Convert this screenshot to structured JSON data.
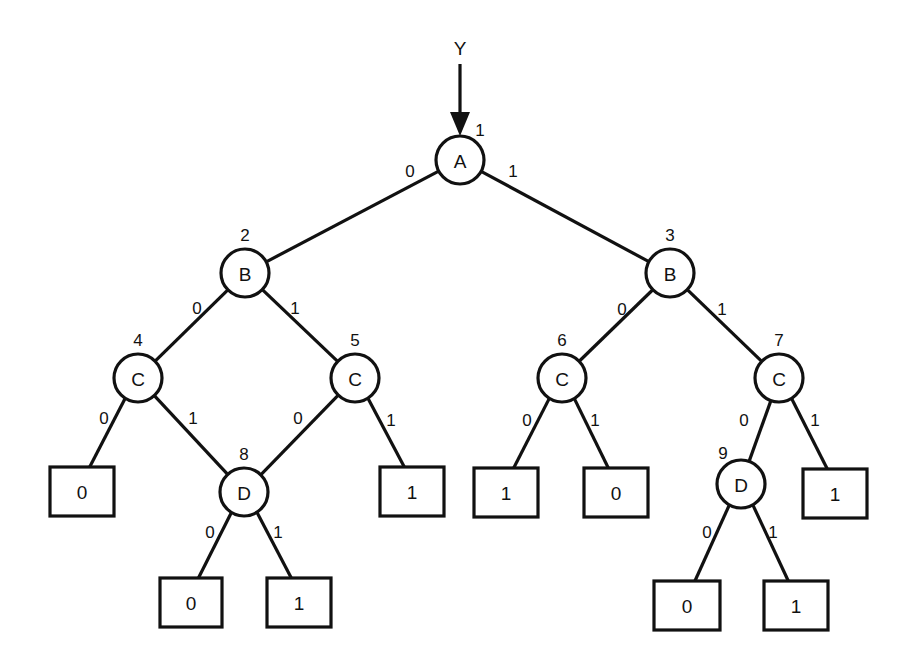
{
  "diagram": {
    "type": "binary-decision-diagram",
    "input_label": "Y",
    "nodes": [
      {
        "id": "1",
        "var": "A",
        "cx": 460,
        "cy": 160,
        "num_dx": 20,
        "num_dy": -30
      },
      {
        "id": "2",
        "var": "B",
        "cx": 245,
        "cy": 273,
        "num_dx": 0,
        "num_dy": -38
      },
      {
        "id": "3",
        "var": "B",
        "cx": 670,
        "cy": 273,
        "num_dx": 0,
        "num_dy": -38
      },
      {
        "id": "4",
        "var": "C",
        "cx": 138,
        "cy": 378,
        "num_dx": 0,
        "num_dy": -38
      },
      {
        "id": "5",
        "var": "C",
        "cx": 355,
        "cy": 378,
        "num_dx": 0,
        "num_dy": -38
      },
      {
        "id": "6",
        "var": "C",
        "cx": 562,
        "cy": 378,
        "num_dx": 0,
        "num_dy": -38
      },
      {
        "id": "7",
        "var": "C",
        "cx": 779,
        "cy": 378,
        "num_dx": 0,
        "num_dy": -38
      },
      {
        "id": "8",
        "var": "D",
        "cx": 244,
        "cy": 492,
        "num_dx": 0,
        "num_dy": -38
      },
      {
        "id": "9",
        "var": "D",
        "cx": 741,
        "cy": 484,
        "num_dx": -18,
        "num_dy": -31
      }
    ],
    "leaves": [
      {
        "key": "L4_0",
        "value": "0",
        "x": 50,
        "y": 467,
        "w": 64,
        "h": 49
      },
      {
        "key": "L5_1",
        "value": "1",
        "x": 380,
        "y": 467,
        "w": 64,
        "h": 49
      },
      {
        "key": "L8_0",
        "value": "0",
        "x": 160,
        "y": 578,
        "w": 62,
        "h": 49
      },
      {
        "key": "L8_1",
        "value": "1",
        "x": 267,
        "y": 578,
        "w": 64,
        "h": 49
      },
      {
        "key": "L6_0",
        "value": "1",
        "x": 474,
        "y": 468,
        "w": 64,
        "h": 49
      },
      {
        "key": "L6_1",
        "value": "0",
        "x": 584,
        "y": 468,
        "w": 64,
        "h": 49
      },
      {
        "key": "L7_1",
        "value": "1",
        "x": 803,
        "y": 469,
        "w": 64,
        "h": 49
      },
      {
        "key": "L9_0",
        "value": "0",
        "x": 654,
        "y": 581,
        "w": 66,
        "h": 49
      },
      {
        "key": "L9_1",
        "value": "1",
        "x": 764,
        "y": 581,
        "w": 64,
        "h": 49
      }
    ],
    "edges": [
      {
        "from": "1",
        "to": "2",
        "label": "0",
        "lx": 410,
        "ly": 171
      },
      {
        "from": "1",
        "to": "3",
        "label": "1",
        "lx": 513,
        "ly": 171
      },
      {
        "from": "2",
        "to": "4",
        "label": "0",
        "lx": 197,
        "ly": 308
      },
      {
        "from": "2",
        "to": "5",
        "label": "1",
        "lx": 295,
        "ly": 308
      },
      {
        "from": "3",
        "to": "6",
        "label": "0",
        "lx": 622,
        "ly": 309
      },
      {
        "from": "3",
        "to": "7",
        "label": "1",
        "lx": 722,
        "ly": 309
      },
      {
        "from": "4",
        "to": "L4_0",
        "label": "0",
        "lx": 104,
        "ly": 418
      },
      {
        "from": "4",
        "to": "8",
        "label": "1",
        "lx": 193,
        "ly": 418
      },
      {
        "from": "5",
        "to": "8",
        "label": "0",
        "lx": 298,
        "ly": 418
      },
      {
        "from": "5",
        "to": "L5_1",
        "label": "1",
        "lx": 391,
        "ly": 420
      },
      {
        "from": "6",
        "to": "L6_0",
        "label": "0",
        "lx": 527,
        "ly": 420
      },
      {
        "from": "6",
        "to": "L6_1",
        "label": "1",
        "lx": 595,
        "ly": 420
      },
      {
        "from": "7",
        "to": "9",
        "label": "0",
        "lx": 744,
        "ly": 420
      },
      {
        "from": "7",
        "to": "L7_1",
        "label": "1",
        "lx": 815,
        "ly": 420
      },
      {
        "from": "8",
        "to": "L8_0",
        "label": "0",
        "lx": 210,
        "ly": 532
      },
      {
        "from": "8",
        "to": "L8_1",
        "label": "1",
        "lx": 278,
        "ly": 532
      },
      {
        "from": "9",
        "to": "L9_0",
        "label": "0",
        "lx": 707,
        "ly": 532
      },
      {
        "from": "9",
        "to": "L9_1",
        "label": "1",
        "lx": 773,
        "ly": 532
      }
    ]
  }
}
